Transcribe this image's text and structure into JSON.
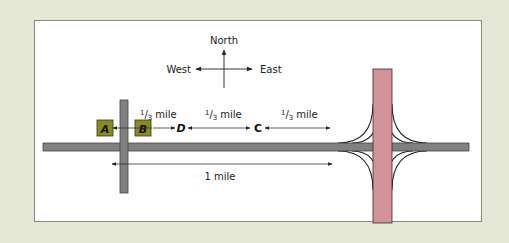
{
  "compass": {
    "north": "North",
    "west": "West",
    "east": "East"
  },
  "segments": [
    {
      "label": "1/3 mile",
      "from": "B",
      "to": "D"
    },
    {
      "label": "1/3 mile",
      "from": "D",
      "to": "C"
    },
    {
      "label": "1/3 mile",
      "from": "C",
      "to": "interchange"
    }
  ],
  "total": {
    "label": "1 mile"
  },
  "points": {
    "A": "A",
    "B": "B",
    "C": "C",
    "D": "D"
  },
  "fraction": {
    "num": "1",
    "den": "3",
    "unit": "mile"
  },
  "colors": {
    "background": "#e4e6d6",
    "panel": "#ffffff",
    "road_gray": "#808080",
    "highway_pink": "#d4939a",
    "box_olive": "#8a8a1e"
  }
}
